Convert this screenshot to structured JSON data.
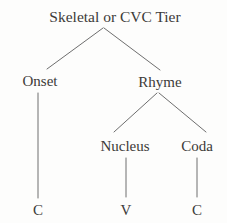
{
  "diagram": {
    "kind": "syllable-structure-tree",
    "title": "Skeletal or CVC Tier",
    "colors": {
      "background": "#fdfdfc",
      "text": "#3c3a38",
      "line": "#6e6e6e"
    },
    "nodes": {
      "root": {
        "label": "Skeletal or CVC Tier"
      },
      "onset": {
        "label": "Onset"
      },
      "rhyme": {
        "label": "Rhyme"
      },
      "nucleus": {
        "label": "Nucleus"
      },
      "coda": {
        "label": "Coda"
      },
      "onset_segment": {
        "label": "C"
      },
      "nucleus_segment": {
        "label": "V"
      },
      "coda_segment": {
        "label": "C"
      }
    },
    "edges": [
      {
        "from": "root",
        "to": "onset"
      },
      {
        "from": "root",
        "to": "rhyme"
      },
      {
        "from": "onset",
        "to": "onset_segment"
      },
      {
        "from": "rhyme",
        "to": "nucleus"
      },
      {
        "from": "rhyme",
        "to": "coda"
      },
      {
        "from": "nucleus",
        "to": "nucleus_segment"
      },
      {
        "from": "coda",
        "to": "coda_segment"
      }
    ]
  }
}
